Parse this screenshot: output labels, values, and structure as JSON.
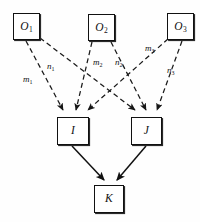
{
  "diagram": {
    "canvas": {
      "width": 200,
      "height": 222,
      "background": "#fefefe"
    },
    "style": {
      "node_stroke": "#111111",
      "node_fill": "#ffffff",
      "dashed_edge_color": "#1a1a1a",
      "solid_edge_color": "#111111"
    },
    "nodes": [
      {
        "id": "O1",
        "base": "O",
        "subscript": "1",
        "x": 13,
        "y": 13,
        "w": 27,
        "h": 27,
        "row": "top"
      },
      {
        "id": "O2",
        "base": "O",
        "subscript": "2",
        "x": 88,
        "y": 14,
        "w": 27,
        "h": 27,
        "row": "top"
      },
      {
        "id": "O3",
        "base": "O",
        "subscript": "3",
        "x": 167,
        "y": 13,
        "w": 27,
        "h": 27,
        "row": "top"
      },
      {
        "id": "I",
        "base": "I",
        "subscript": "",
        "x": 57,
        "y": 117,
        "w": 32,
        "h": 28,
        "row": "middle"
      },
      {
        "id": "J",
        "base": "J",
        "subscript": "",
        "x": 131,
        "y": 117,
        "w": 31,
        "h": 28,
        "row": "middle"
      },
      {
        "id": "K",
        "base": "K",
        "subscript": "",
        "x": 94,
        "y": 185,
        "w": 30,
        "h": 28,
        "row": "bottom"
      }
    ],
    "edges": [
      {
        "id": "e-o1-i",
        "from": "O1",
        "to": "I",
        "style": "dashed",
        "label": "m",
        "label_sub": "1",
        "label_x": 23,
        "label_y": 75
      },
      {
        "id": "e-o1-j",
        "from": "O1",
        "to": "J",
        "style": "dashed",
        "label": "n",
        "label_sub": "1",
        "label_x": 47,
        "label_y": 62
      },
      {
        "id": "e-o2-i",
        "from": "O2",
        "to": "I",
        "style": "dashed",
        "label": "m",
        "label_sub": "2",
        "label_x": 93,
        "label_y": 58
      },
      {
        "id": "e-o2-j",
        "from": "O2",
        "to": "J",
        "style": "dashed",
        "label": "n",
        "label_sub": "2",
        "label_x": 115,
        "label_y": 58
      },
      {
        "id": "e-o3-i",
        "from": "O3",
        "to": "I",
        "style": "dashed",
        "label": "m",
        "label_sub": "3",
        "label_x": 145,
        "label_y": 44
      },
      {
        "id": "e-o3-j",
        "from": "O3",
        "to": "J",
        "style": "dashed",
        "label": "n",
        "label_sub": "3",
        "label_x": 167,
        "label_y": 66
      },
      {
        "id": "e-i-k",
        "from": "I",
        "to": "K",
        "style": "solid",
        "label": "",
        "label_sub": "",
        "label_x": 0,
        "label_y": 0
      },
      {
        "id": "e-j-k",
        "from": "J",
        "to": "K",
        "style": "solid",
        "label": "",
        "label_sub": "",
        "label_x": 0,
        "label_y": 0
      }
    ]
  }
}
